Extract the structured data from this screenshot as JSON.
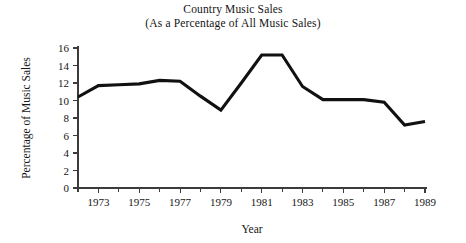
{
  "chart_data": {
    "type": "line",
    "title": "Country Music Sales",
    "subtitle": "(As a Percentage of All Music Sales)",
    "xlabel": "Year",
    "ylabel": "Percentage of Music Sales",
    "xlim": [
      1972,
      1989
    ],
    "ylim": [
      0,
      16
    ],
    "grid": false,
    "legend": "none",
    "line_color": "#111111",
    "axis_color": "#3b3b3b",
    "y_ticks": [
      0,
      2,
      4,
      6,
      8,
      10,
      12,
      14,
      16
    ],
    "y_tick_labels": [
      "0",
      "2",
      "4",
      "6",
      "8",
      "10",
      "12",
      "14",
      "16"
    ],
    "x_ticks": [
      1973,
      1975,
      1977,
      1979,
      1981,
      1983,
      1985,
      1987,
      1989
    ],
    "x_tick_labels": [
      "1973",
      "1975",
      "1977",
      "1979",
      "1981",
      "1983",
      "1985",
      "1987",
      "1989"
    ],
    "x_minor_ticks": [
      1972,
      1974,
      1976,
      1978,
      1980,
      1982,
      1984,
      1986,
      1988
    ],
    "x": [
      1972,
      1973,
      1974,
      1975,
      1976,
      1977,
      1978,
      1979,
      1980,
      1981,
      1982,
      1983,
      1984,
      1985,
      1986,
      1987,
      1988,
      1989
    ],
    "values": [
      10.4,
      11.7,
      11.8,
      11.9,
      12.3,
      12.2,
      10.5,
      8.9,
      12.0,
      15.2,
      15.2,
      11.6,
      10.1,
      10.1,
      10.1,
      9.8,
      7.2,
      7.6
    ],
    "series": [
      {
        "name": "Country Music Sales",
        "values": [
          10.4,
          11.7,
          11.8,
          11.9,
          12.3,
          12.2,
          10.5,
          8.9,
          12.0,
          15.2,
          15.2,
          11.6,
          10.1,
          10.1,
          10.1,
          9.8,
          7.2,
          7.6
        ]
      }
    ]
  }
}
